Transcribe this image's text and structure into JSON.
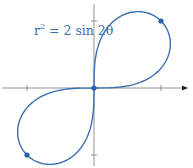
{
  "chart_data": {
    "type": "line",
    "title": "",
    "equation": "r^2 = 2 sin 2θ",
    "equation_parts": {
      "lhs_base": "r",
      "lhs_exp": "2",
      "rhs": " = 2 sin 2θ"
    },
    "xlabel": "",
    "ylabel": "",
    "curve": "lemniscate r^2 = 2 sin 2θ (polar)",
    "xlim": [
      -1.4,
      1.4
    ],
    "ylim": [
      -1.2,
      1.2
    ],
    "x_ticks": [
      -1,
      1
    ],
    "y_ticks": [
      -1,
      1
    ],
    "marked_points": [
      {
        "x": 0,
        "y": 0
      },
      {
        "x": 1,
        "y": 1
      },
      {
        "x": -1,
        "y": -1
      }
    ],
    "grid": false,
    "legend": "none"
  },
  "style": {
    "curve_color": "#3a6fb0",
    "axis_color": "#777777",
    "point_color": "#2a62ad"
  },
  "layout": {
    "origin_px": [
      94,
      88
    ],
    "unit_px": 67
  }
}
